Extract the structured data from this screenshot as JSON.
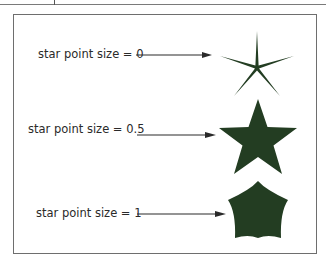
{
  "diagram": {
    "rows": [
      {
        "label": "star point size = 0",
        "star_point_size": 0
      },
      {
        "label": "star point size = 0.5",
        "star_point_size": 0.5
      },
      {
        "label": "star point size = 1",
        "star_point_size": 1
      }
    ],
    "colors": {
      "star_fill": "#233d22",
      "frame": "#6e6e6e",
      "arrow": "#2a2a2a",
      "text": "#2a2a2a"
    }
  }
}
